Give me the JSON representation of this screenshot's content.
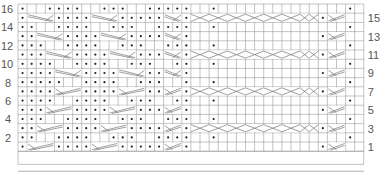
{
  "chart": {
    "rows": 16,
    "cols": 38,
    "left_row_labels": [
      "2",
      "4",
      "6",
      "8",
      "10",
      "12",
      "14",
      "16"
    ],
    "right_row_labels": [
      "1",
      "3",
      "5",
      "7",
      "9",
      "11",
      "13",
      "15"
    ],
    "colors": {
      "grid": "#9a9a9a",
      "line": "#777777",
      "dot": "#222222",
      "text": "#555555"
    },
    "legend": {
      "dot": "purl",
      "blank": "knit",
      "diagonal": "cable cross / travelling stitch"
    }
  },
  "grid_rows": [
    {
      "row": 16,
      "cells": "p..pppp..ppp..ppppp..p..............p.."
    },
    {
      "row": 15,
      "cells": "p>>>pppp>>>ppppp>>p<<<<<<<<<<<<<<p<<"
    },
    {
      "row": 14,
      "cells": "pp..pppp..ppp..pppp..p..............p.."
    },
    {
      "row": 13,
      "cells": "pp>>>pppp>>>pppp>>p..............p<<"
    },
    {
      "row": 12,
      "cells": "ppp..pppp..ppp..ppp..p..............p.."
    },
    {
      "row": 11,
      "cells": "ppp>>>pppp>>>ppp>>p<<<<<<<<<<<<<<p<<"
    },
    {
      "row": 10,
      "cells": "pppp..pppp..ppp..pp..p..............p.."
    },
    {
      "row": 9,
      "cells": "pppp>>>pppp>>>pp>>p..............p<<"
    },
    {
      "row": 8,
      "cells": "ppppp..pppp..ppp..p..p..............p.."
    },
    {
      "row": 7,
      "cells": "pppp<<<pppp<<<pp<<p<<<<<<<<<<<<<<p<<"
    },
    {
      "row": 6,
      "cells": "pppp..pppp..ppp..pp..p..............p.."
    },
    {
      "row": 5,
      "cells": "ppp<<<pppp<<<ppp<<p..............p<<"
    },
    {
      "row": 4,
      "cells": "ppp..pppp..ppp..ppp..p..............p.."
    },
    {
      "row": 3,
      "cells": "pp<<<pppp<<<pppp<<p<<<<<<<<<<<<<<p<<"
    },
    {
      "row": 2,
      "cells": "pp..pppp..ppp..pppp..p..............p.."
    },
    {
      "row": 1,
      "cells": "p<<<pppp<<<ppppp<<p..............p<<"
    }
  ]
}
